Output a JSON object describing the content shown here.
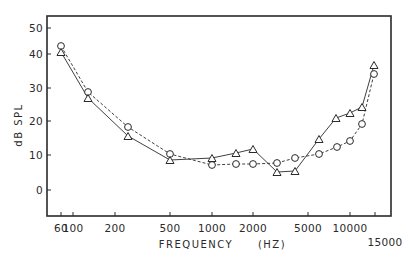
{
  "chart_data": {
    "type": "line",
    "title": "",
    "xlabel": "FREQUENCY",
    "xlabel_unit": "(HZ)",
    "ylabel": "dB SPL",
    "xscale": "log",
    "ylim": [
      -5,
      55
    ],
    "grid": false,
    "legend": null,
    "y_ticks": [
      {
        "value": 50,
        "label": "50",
        "py": 28
      },
      {
        "value": 40,
        "label": "40",
        "py": 54
      },
      {
        "value": 30,
        "label": "30",
        "py": 88
      },
      {
        "value": 20,
        "label": "20",
        "py": 121
      },
      {
        "value": 10,
        "label": "10",
        "py": 155
      },
      {
        "value": 0,
        "label": "0",
        "py": 190
      }
    ],
    "x_ticks": [
      {
        "value": 60,
        "label": "60",
        "px": 61,
        "row": 0
      },
      {
        "value": 100,
        "label": "100",
        "px": 73,
        "row": 0
      },
      {
        "value": 200,
        "label": "200",
        "px": 115,
        "row": 0
      },
      {
        "value": 500,
        "label": "500",
        "px": 170,
        "row": 0
      },
      {
        "value": 1000,
        "label": "1000",
        "px": 212,
        "row": 0
      },
      {
        "value": 2000,
        "label": "2000",
        "px": 253,
        "row": 0
      },
      {
        "value": 5000,
        "label": "5000",
        "px": 308,
        "row": 0
      },
      {
        "value": 10000,
        "label": "10000",
        "px": 350,
        "row": 0
      },
      {
        "value": 15000,
        "label": "15000",
        "px": 375,
        "row": 1
      }
    ],
    "x": [
      60,
      125,
      250,
      500,
      1000,
      1500,
      2000,
      3000,
      4000,
      6000,
      8000,
      10000,
      12500,
      15000
    ],
    "series": [
      {
        "name": "circles (dashed)",
        "marker": "circle",
        "line": "dashed",
        "values": [
          42,
          29,
          18.5,
          10.6,
          7.4,
          7.6,
          7.6,
          8,
          9.5,
          10.6,
          12.6,
          14.4,
          19.4,
          34
        ],
        "px": [
          61,
          88,
          128,
          170,
          212,
          236,
          253,
          277,
          295,
          319,
          337,
          350,
          362,
          374
        ],
        "py": [
          46,
          92,
          127,
          154,
          165,
          164,
          164,
          163,
          158,
          154,
          147,
          141,
          124,
          74
        ]
      },
      {
        "name": "triangles (solid)",
        "marker": "triangle",
        "line": "solid",
        "values": [
          40.5,
          27,
          16,
          9,
          9.4,
          11,
          12,
          5.3,
          5.6,
          15,
          21,
          22.6,
          24.4,
          36.8
        ],
        "px": [
          61,
          88,
          128,
          170,
          212,
          236,
          253,
          277,
          295,
          319,
          336,
          350,
          362,
          374
        ],
        "py": [
          52,
          98,
          136,
          160,
          158,
          153,
          149,
          172,
          171,
          139,
          118,
          113,
          107,
          65
        ]
      }
    ]
  },
  "colors": {
    "ink": "#2a2a2a",
    "background": "#ffffff"
  },
  "frame": {
    "left": 47,
    "top": 16,
    "right": 391,
    "bottom": 216
  }
}
